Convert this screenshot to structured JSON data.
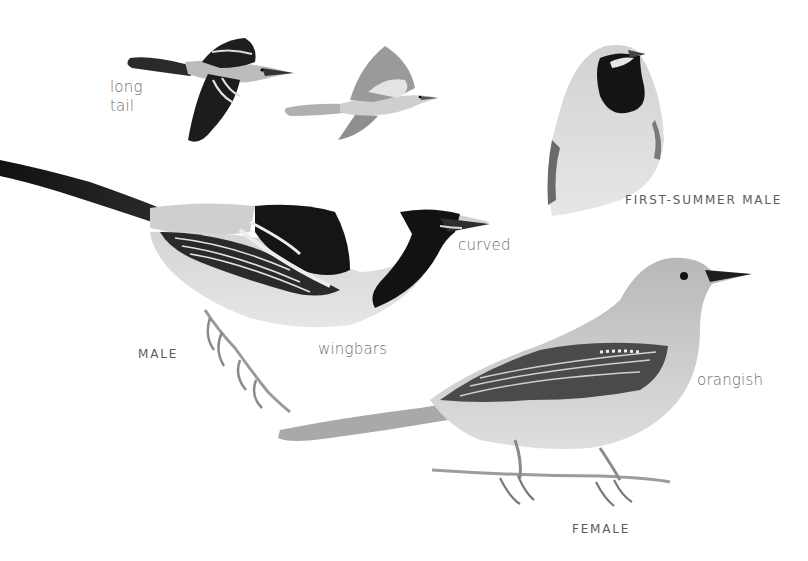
{
  "plate": {
    "figures": [
      {
        "id": "flight-male",
        "caption": ""
      },
      {
        "id": "flight-female",
        "caption": ""
      },
      {
        "id": "first-summer-male",
        "caption": "FIRST-SUMMER MALE"
      },
      {
        "id": "adult-male",
        "caption": "MALE"
      },
      {
        "id": "adult-female",
        "caption": "FEMALE"
      }
    ],
    "annotations": {
      "long_tail_line1": "long",
      "long_tail_line2": "tail",
      "curved": "curved",
      "wingbars": "wingbars",
      "orangish": "orangish"
    },
    "captions": {
      "first_summer_male": "FIRST-SUMMER MALE",
      "male": "MALE",
      "female": "FEMALE"
    },
    "colors": {
      "background": "#ffffff",
      "black_plumage": "#1a1a1a",
      "body_light": "#d9d9d9",
      "body_mid": "#bdbdbd",
      "label_text": "#6e6e6e"
    }
  }
}
